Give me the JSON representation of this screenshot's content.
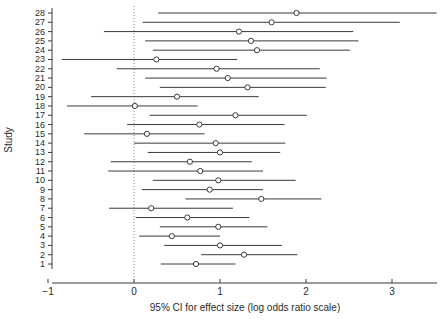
{
  "chart_data": {
    "type": "scatter",
    "title": "",
    "xlabel": "95% CI for effect size (log odds ratio scale)",
    "ylabel": "Study",
    "xlim": [
      -1.35,
      3.6
    ],
    "ylim": [
      0.4,
      28.6
    ],
    "xticks": [
      -1,
      0,
      1,
      2,
      3
    ],
    "xtick_labels": [
      "−1",
      "0",
      "1",
      "2",
      "3"
    ],
    "ytick_labels": [
      "1",
      "2",
      "3",
      "4",
      "5",
      "6",
      "7",
      "8",
      "9",
      "10",
      "11",
      "12",
      "13",
      "14",
      "15",
      "16",
      "17",
      "18",
      "19",
      "20",
      "21",
      "22",
      "23",
      "24",
      "25",
      "26",
      "27",
      "28"
    ],
    "grid": false,
    "legend": null,
    "reference_line": 0,
    "reference_line_style": "dotted",
    "marker_style": "open-circle",
    "series_name": "95% CI for effect size",
    "points": [
      {
        "study": 28,
        "estimate": 1.89,
        "ci_low": 0.28,
        "ci_high": 3.52
      },
      {
        "study": 27,
        "estimate": 1.6,
        "ci_low": 0.1,
        "ci_high": 3.09
      },
      {
        "study": 26,
        "estimate": 1.22,
        "ci_low": -0.35,
        "ci_high": 2.55
      },
      {
        "study": 25,
        "estimate": 1.36,
        "ci_low": 0.13,
        "ci_high": 2.61
      },
      {
        "study": 24,
        "estimate": 1.43,
        "ci_low": 0.22,
        "ci_high": 2.51
      },
      {
        "study": 23,
        "estimate": 0.26,
        "ci_low": -0.84,
        "ci_high": 1.2
      },
      {
        "study": 22,
        "estimate": 0.96,
        "ci_low": -0.2,
        "ci_high": 2.16
      },
      {
        "study": 21,
        "estimate": 1.09,
        "ci_low": 0.13,
        "ci_high": 2.24
      },
      {
        "study": 20,
        "estimate": 1.32,
        "ci_low": 0.3,
        "ci_high": 2.23
      },
      {
        "study": 19,
        "estimate": 0.5,
        "ci_low": -0.5,
        "ci_high": 1.45
      },
      {
        "study": 18,
        "estimate": 0.01,
        "ci_low": -0.78,
        "ci_high": 0.74
      },
      {
        "study": 17,
        "estimate": 1.18,
        "ci_low": 0.18,
        "ci_high": 2.01
      },
      {
        "study": 16,
        "estimate": 0.76,
        "ci_low": -0.08,
        "ci_high": 1.75
      },
      {
        "study": 15,
        "estimate": 0.15,
        "ci_low": -0.58,
        "ci_high": 0.82
      },
      {
        "study": 14,
        "estimate": 0.95,
        "ci_low": 0.0,
        "ci_high": 1.76
      },
      {
        "study": 13,
        "estimate": 1.0,
        "ci_low": 0.16,
        "ci_high": 1.7
      },
      {
        "study": 12,
        "estimate": 0.65,
        "ci_low": -0.27,
        "ci_high": 1.37
      },
      {
        "study": 11,
        "estimate": 0.77,
        "ci_low": -0.3,
        "ci_high": 1.5
      },
      {
        "study": 10,
        "estimate": 0.98,
        "ci_low": 0.22,
        "ci_high": 1.88
      },
      {
        "study": 9,
        "estimate": 0.88,
        "ci_low": 0.09,
        "ci_high": 1.5
      },
      {
        "study": 8,
        "estimate": 1.48,
        "ci_low": 0.6,
        "ci_high": 2.18
      },
      {
        "study": 7,
        "estimate": 0.2,
        "ci_low": -0.29,
        "ci_high": 1.15
      },
      {
        "study": 6,
        "estimate": 0.62,
        "ci_low": 0.02,
        "ci_high": 1.34
      },
      {
        "study": 5,
        "estimate": 0.98,
        "ci_low": 0.3,
        "ci_high": 1.55
      },
      {
        "study": 4,
        "estimate": 0.44,
        "ci_low": 0.06,
        "ci_high": 1.0
      },
      {
        "study": 3,
        "estimate": 1.0,
        "ci_low": 0.35,
        "ci_high": 1.72
      },
      {
        "study": 2,
        "estimate": 1.28,
        "ci_low": 0.78,
        "ci_high": 1.9
      },
      {
        "study": 1,
        "estimate": 0.72,
        "ci_low": 0.31,
        "ci_high": 1.18
      }
    ]
  }
}
